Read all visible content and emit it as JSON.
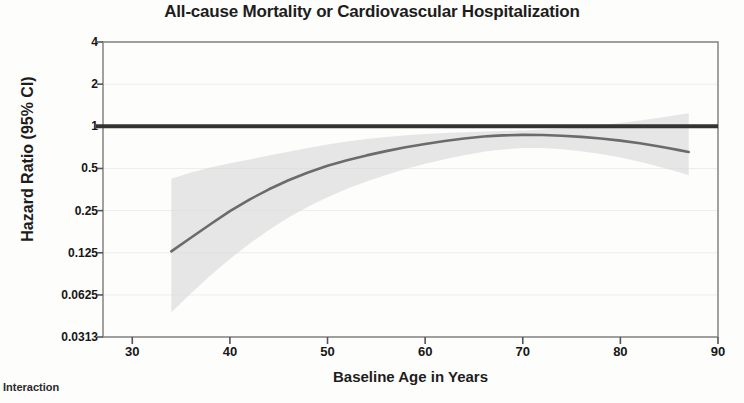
{
  "footnote": "Interaction",
  "chart_data": {
    "type": "line",
    "title": "All-cause Mortality or Cardiovascular Hospitalization",
    "xlabel": "Baseline Age in Years",
    "ylabel": "Hazard Ratio (95% CI)",
    "yscale": "log2",
    "ylim": [
      0.0313,
      4
    ],
    "xlim": [
      27,
      90
    ],
    "grid": true,
    "legend": "none",
    "xticks": [
      30,
      40,
      50,
      60,
      70,
      80,
      90
    ],
    "xtick_labels": [
      "30",
      "40",
      "50",
      "60",
      "70",
      "80",
      "90"
    ],
    "yticks": [
      4,
      2,
      1,
      0.5,
      0.25,
      0.125,
      0.0625,
      0.0313
    ],
    "ytick_labels": [
      "4",
      "2",
      "1",
      "0.5",
      "0.25",
      "0.125",
      "0.0625",
      "0.0313"
    ],
    "reference_line": {
      "y": 1,
      "label": "null effect",
      "color": "#333333",
      "width": 4
    },
    "colors": {
      "curve": "#6b6b6b",
      "band": "#d9d9d9",
      "reference": "#333333",
      "axis": "#8a8a8a",
      "grid": "#ededed",
      "text": "#161616",
      "background": "#fdfdfb"
    },
    "series": [
      {
        "name": "Hazard Ratio",
        "x": [
          34,
          36,
          38,
          40,
          42,
          44,
          46,
          48,
          50,
          52,
          54,
          56,
          58,
          60,
          62,
          64,
          66,
          67,
          68,
          70,
          72,
          74,
          76,
          78,
          80,
          82,
          84,
          85,
          86,
          87
        ],
        "values": [
          0.128,
          0.16,
          0.2,
          0.248,
          0.3,
          0.355,
          0.412,
          0.468,
          0.522,
          0.572,
          0.62,
          0.665,
          0.708,
          0.748,
          0.785,
          0.818,
          0.845,
          0.855,
          0.862,
          0.868,
          0.866,
          0.856,
          0.84,
          0.818,
          0.79,
          0.757,
          0.718,
          0.698,
          0.676,
          0.655
        ]
      }
    ],
    "confidence_band": {
      "level": "95%",
      "x": [
        34,
        36,
        38,
        40,
        42,
        44,
        46,
        48,
        50,
        52,
        54,
        56,
        58,
        60,
        62,
        64,
        66,
        67,
        68,
        70,
        72,
        74,
        76,
        78,
        80,
        82,
        84,
        85,
        86,
        87
      ],
      "lower": [
        0.047,
        0.064,
        0.086,
        0.113,
        0.145,
        0.182,
        0.223,
        0.267,
        0.312,
        0.358,
        0.404,
        0.45,
        0.495,
        0.54,
        0.582,
        0.622,
        0.657,
        0.672,
        0.684,
        0.7,
        0.7,
        0.687,
        0.664,
        0.634,
        0.598,
        0.558,
        0.514,
        0.492,
        0.47,
        0.448
      ],
      "upper": [
        0.422,
        0.468,
        0.508,
        0.545,
        0.58,
        0.618,
        0.658,
        0.7,
        0.742,
        0.78,
        0.812,
        0.84,
        0.862,
        0.88,
        0.895,
        0.908,
        0.918,
        0.922,
        0.926,
        0.935,
        0.948,
        0.966,
        0.99,
        1.02,
        1.058,
        1.102,
        1.152,
        1.18,
        1.208,
        1.238
      ]
    },
    "annotations": [
      {
        "text": "Curve crosses no region above HR = 1 except upper CI at oldest ages",
        "visible": false
      }
    ]
  }
}
